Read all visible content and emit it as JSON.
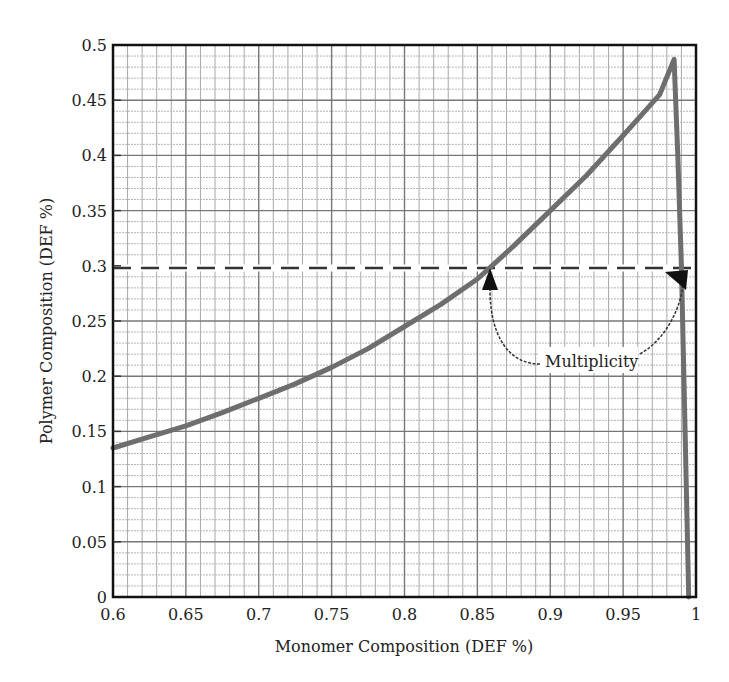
{
  "chart_data": {
    "type": "line",
    "title": "",
    "xlabel": "Monomer Composition (DEF %)",
    "ylabel": "Polymer Composition (DEF %)",
    "xlim": [
      0.6,
      1.0
    ],
    "ylim": [
      0,
      0.5
    ],
    "grid": true,
    "grid_minor_x": 0.01,
    "grid_minor_y": 0.01,
    "x_ticks": [
      0.6,
      0.65,
      0.7,
      0.75,
      0.8,
      0.85,
      0.9,
      0.95,
      1
    ],
    "x_tick_labels": [
      "0.6",
      "0.65",
      "0.7",
      "0.75",
      "0.8",
      "0.85",
      "0.9",
      "0.95",
      "1"
    ],
    "y_ticks": [
      0,
      0.05,
      0.1,
      0.15,
      0.2,
      0.25,
      0.3,
      0.35,
      0.4,
      0.45,
      0.5
    ],
    "y_tick_labels": [
      "0",
      "0.05",
      "0.1",
      "0.15",
      "0.2",
      "0.25",
      "0.3",
      "0.35",
      "0.4",
      "0.45",
      "0.5"
    ],
    "legend": null,
    "series": [
      {
        "name": "Polymer vs Monomer Composition",
        "color": "#6e6e6e",
        "x": [
          0.6,
          0.625,
          0.65,
          0.675,
          0.7,
          0.725,
          0.75,
          0.775,
          0.8,
          0.825,
          0.85,
          0.86,
          0.875,
          0.9,
          0.925,
          0.95,
          0.965,
          0.975,
          0.985,
          0.9875,
          0.99,
          0.9925,
          0.995
        ],
        "y": [
          0.135,
          0.145,
          0.155,
          0.167,
          0.18,
          0.193,
          0.208,
          0.225,
          0.245,
          0.265,
          0.288,
          0.3,
          0.318,
          0.35,
          0.382,
          0.418,
          0.44,
          0.455,
          0.487,
          0.4,
          0.3,
          0.15,
          0.0
        ]
      }
    ],
    "reference_line": {
      "type": "horizontal_dashed",
      "y": 0.298,
      "x_range": [
        0.6,
        1.0
      ],
      "color": "#333333"
    },
    "annotations": [
      {
        "text": "Multiplicity",
        "x": 0.925,
        "y": 0.205,
        "arrows_to": [
          [
            0.857,
            0.29
          ],
          [
            0.985,
            0.29
          ]
        ]
      }
    ]
  },
  "axes": {
    "x_title": "Monomer Composition (DEF %)",
    "y_title": "Polymer Composition (DEF %)"
  },
  "annotation_label": "Multiplicity"
}
